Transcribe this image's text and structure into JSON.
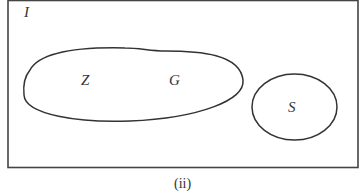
{
  "diagram": {
    "universe_label": "I",
    "sets": [
      {
        "name": "Z",
        "label": "Z"
      },
      {
        "name": "G",
        "label": "G"
      },
      {
        "name": "S",
        "label": "S"
      }
    ],
    "caption": "(ii)",
    "colors": {
      "stroke": "#333333",
      "background": "#ffffff"
    }
  }
}
